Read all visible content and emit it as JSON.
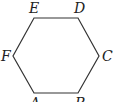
{
  "diagram": {
    "type": "regular-hexagon",
    "stroke_color": "#333333",
    "vertices": [
      {
        "label": "A",
        "x": 34,
        "y": 93,
        "lx": 30,
        "ly": 108
      },
      {
        "label": "B",
        "x": 78,
        "y": 93,
        "lx": 75,
        "ly": 108
      },
      {
        "label": "C",
        "x": 99,
        "y": 56,
        "lx": 102,
        "ly": 61
      },
      {
        "label": "D",
        "x": 78,
        "y": 18,
        "lx": 74,
        "ly": 13
      },
      {
        "label": "E",
        "x": 34,
        "y": 18,
        "lx": 29,
        "ly": 13
      },
      {
        "label": "F",
        "x": 13,
        "y": 56,
        "lx": 1,
        "ly": 61
      }
    ]
  }
}
